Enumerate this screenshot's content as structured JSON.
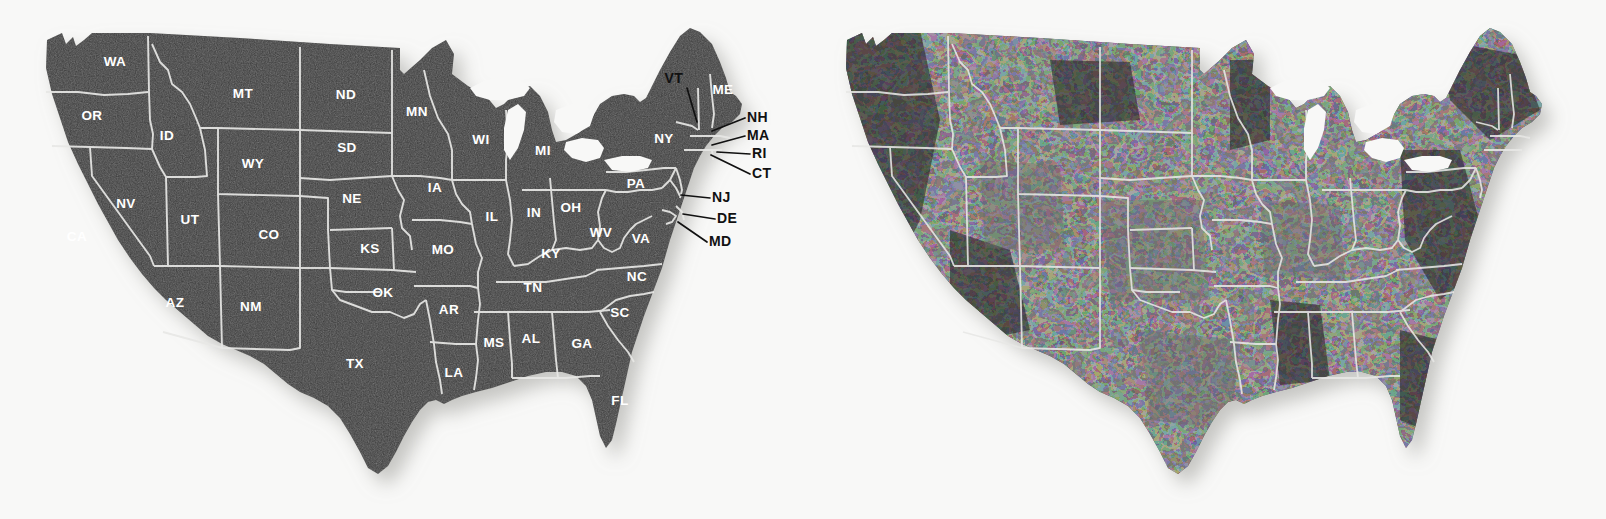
{
  "page": {
    "background_color": "#f8f8f7",
    "width": 1606,
    "height": 519
  },
  "palette": {
    "land_fill": "#3c3c3c",
    "land_fill_dark": "#2a2a2a",
    "land_fill_light": "#5e5e5e",
    "border_stroke": "#e8e8e6",
    "label_color": "#ffffff",
    "callout_color": "#111111",
    "shadow_color": "#c9c9c7"
  },
  "maps": [
    {
      "id": "state-reference-map",
      "name": "state-abbreviation-map",
      "style": "uniform-dark-fill-with-state-abbreviation-labels",
      "fill": "#3c3c3c",
      "border": "#e8e8e6"
    },
    {
      "id": "county-choropleth-map",
      "name": "county-shaded-map",
      "style": "mottled-county-level-grayscale-choropleth",
      "fill_light": "#5e5e5e",
      "fill_dark": "#242424",
      "border": "#e8e8e6"
    }
  ],
  "state_labels": [
    {
      "abbr": "WA",
      "x": 115,
      "y": 66
    },
    {
      "abbr": "OR",
      "x": 92,
      "y": 120
    },
    {
      "abbr": "ID",
      "x": 167,
      "y": 140
    },
    {
      "abbr": "MT",
      "x": 243,
      "y": 98
    },
    {
      "abbr": "ND",
      "x": 346,
      "y": 99
    },
    {
      "abbr": "SD",
      "x": 347,
      "y": 152
    },
    {
      "abbr": "WY",
      "x": 253,
      "y": 168
    },
    {
      "abbr": "NV",
      "x": 126,
      "y": 208
    },
    {
      "abbr": "CA",
      "x": 77,
      "y": 241
    },
    {
      "abbr": "UT",
      "x": 190,
      "y": 224
    },
    {
      "abbr": "CO",
      "x": 269,
      "y": 239
    },
    {
      "abbr": "NE",
      "x": 352,
      "y": 203
    },
    {
      "abbr": "KS",
      "x": 370,
      "y": 253
    },
    {
      "abbr": "AZ",
      "x": 175,
      "y": 307
    },
    {
      "abbr": "NM",
      "x": 251,
      "y": 311
    },
    {
      "abbr": "OK",
      "x": 383,
      "y": 297
    },
    {
      "abbr": "TX",
      "x": 355,
      "y": 368
    },
    {
      "abbr": "MN",
      "x": 417,
      "y": 116
    },
    {
      "abbr": "IA",
      "x": 435,
      "y": 192
    },
    {
      "abbr": "MO",
      "x": 443,
      "y": 254
    },
    {
      "abbr": "AR",
      "x": 449,
      "y": 314
    },
    {
      "abbr": "LA",
      "x": 454,
      "y": 377
    },
    {
      "abbr": "WI",
      "x": 481,
      "y": 144
    },
    {
      "abbr": "IL",
      "x": 492,
      "y": 221
    },
    {
      "abbr": "MS",
      "x": 494,
      "y": 347
    },
    {
      "abbr": "MI",
      "x": 543,
      "y": 155
    },
    {
      "abbr": "IN",
      "x": 534,
      "y": 217
    },
    {
      "abbr": "AL",
      "x": 531,
      "y": 343
    },
    {
      "abbr": "OH",
      "x": 571,
      "y": 212
    },
    {
      "abbr": "KY",
      "x": 551,
      "y": 258
    },
    {
      "abbr": "TN",
      "x": 533,
      "y": 292
    },
    {
      "abbr": "GA",
      "x": 582,
      "y": 348
    },
    {
      "abbr": "WV",
      "x": 601,
      "y": 237
    },
    {
      "abbr": "VA",
      "x": 641,
      "y": 243
    },
    {
      "abbr": "NC",
      "x": 637,
      "y": 281
    },
    {
      "abbr": "SC",
      "x": 620,
      "y": 317
    },
    {
      "abbr": "FL",
      "x": 620,
      "y": 405
    },
    {
      "abbr": "PA",
      "x": 636,
      "y": 188
    },
    {
      "abbr": "NY",
      "x": 664,
      "y": 143
    },
    {
      "abbr": "ME",
      "x": 723,
      "y": 94
    }
  ],
  "callouts": [
    {
      "abbr": "VT",
      "label_x": 683,
      "label_y": 83,
      "anchor": "end",
      "line": "M 687 88 L 697 122"
    },
    {
      "abbr": "NH",
      "label_x": 747,
      "label_y": 122,
      "anchor": "start",
      "line": "M 745 118 L 712 131"
    },
    {
      "abbr": "MA",
      "label_x": 747,
      "label_y": 140,
      "anchor": "start",
      "line": "M 745 136 L 712 145"
    },
    {
      "abbr": "RI",
      "label_x": 752,
      "label_y": 158,
      "anchor": "start",
      "line": "M 750 154 L 717 152"
    },
    {
      "abbr": "CT",
      "label_x": 752,
      "label_y": 178,
      "anchor": "start",
      "line": "M 750 174 L 711 155"
    },
    {
      "abbr": "NJ",
      "label_x": 712,
      "label_y": 202,
      "anchor": "start",
      "line": "M 710 198 L 681 195"
    },
    {
      "abbr": "DE",
      "label_x": 717,
      "label_y": 223,
      "anchor": "start",
      "line": "M 715 219 L 683 214"
    },
    {
      "abbr": "MD",
      "label_x": 709,
      "label_y": 246,
      "anchor": "start",
      "line": "M 707 242 L 678 222"
    }
  ],
  "counts": {
    "state_labels_shown": 40,
    "callout_labels_shown": 8,
    "maps_shown": 2
  }
}
